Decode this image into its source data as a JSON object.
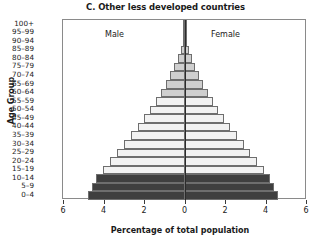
{
  "chart_title": "C. Other less developed countries",
  "axis": {
    "y_title": "Age Group",
    "x_title": "Percentage of total population",
    "x_ticks": [
      "6",
      "4",
      "2",
      "0",
      "2",
      "4",
      "6"
    ],
    "x_tick_values": [
      -6,
      -4,
      -2,
      0,
      2,
      4,
      6
    ],
    "x_min": -6,
    "x_max": 6
  },
  "panels": {
    "left_label": "Male",
    "right_label": "Female"
  },
  "colors": {
    "bar_light": "#f2f2f2",
    "bar_mid": "#cfcfcf",
    "bar_dark": "#3f3f3f",
    "bar_outline": "#6e6e6e",
    "axis": "#8a8a8a",
    "center_line": "#2b2b2b",
    "text": "#1a1a1a",
    "background": "#ffffff"
  },
  "chart_data": {
    "type": "bar",
    "subtype": "population-pyramid",
    "title": "C. Other less developed countries",
    "xlabel": "Percentage of total population",
    "ylabel": "Age Group",
    "xlim": [
      -6,
      6
    ],
    "grid": false,
    "legend": null,
    "categories": [
      "0–4",
      "5–9",
      "10–14",
      "15–19",
      "20–24",
      "25–29",
      "30–34",
      "35–39",
      "40–44",
      "45–49",
      "50–54",
      "55–59",
      "60–64",
      "65–69",
      "70–74",
      "75–79",
      "80–84",
      "85–89",
      "90–94",
      "95–99",
      "100+"
    ],
    "series": [
      {
        "name": "Male",
        "side": "left",
        "values": [
          4.75,
          4.55,
          4.35,
          4.05,
          3.7,
          3.35,
          3.0,
          2.65,
          2.3,
          2.0,
          1.7,
          1.42,
          1.15,
          0.92,
          0.7,
          0.5,
          0.32,
          0.18,
          0.09,
          0.035,
          0.01
        ]
      },
      {
        "name": "Female",
        "side": "right",
        "values": [
          4.6,
          4.42,
          4.22,
          3.95,
          3.6,
          3.25,
          2.92,
          2.58,
          2.25,
          1.95,
          1.66,
          1.4,
          1.14,
          0.92,
          0.72,
          0.53,
          0.35,
          0.21,
          0.11,
          0.045,
          0.012
        ]
      }
    ],
    "bar_shades": [
      "dark",
      "dark",
      "dark",
      "light",
      "light",
      "light",
      "light",
      "light",
      "light",
      "light",
      "light",
      "light",
      "mid",
      "mid",
      "mid",
      "mid",
      "mid",
      "mid",
      "mid",
      "mid",
      "mid"
    ]
  }
}
